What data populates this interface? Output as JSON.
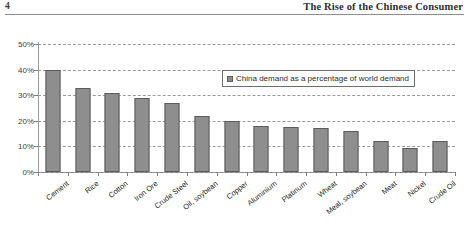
{
  "page": {
    "number": "4",
    "running_head": "The Rise of the Chinese Consumer"
  },
  "chart_data": {
    "type": "bar",
    "title": "",
    "xlabel": "",
    "ylabel": "",
    "ylim": [
      0,
      50
    ],
    "yticks": [
      0,
      10,
      20,
      30,
      40,
      50
    ],
    "ytick_labels": [
      "0%",
      "10%",
      "20%",
      "30%",
      "40%",
      "50%"
    ],
    "grid": true,
    "legend_position": "inside-upper-right",
    "legend": [
      "China demand as a percentage of world demand"
    ],
    "categories": [
      "Cement",
      "Rice",
      "Cotton",
      "Iron Ore",
      "Crude Steel",
      "Oil, soybean",
      "Copper",
      "Aluminium",
      "Platinum",
      "Wheat",
      "Meal, soybean",
      "Meat",
      "Nickel",
      "Crude Oil"
    ],
    "series": [
      {
        "name": "China demand as a percentage of world demand",
        "values": [
          40,
          33,
          31,
          29,
          27,
          22,
          20,
          18,
          17.5,
          17,
          16,
          12,
          9.5,
          12
        ]
      }
    ],
    "colors": {
      "bar_fill": "#8e8e8e",
      "bar_border": "#5c5c5c",
      "gridline": "#9a9a9a",
      "axis": "#7d7d7d"
    }
  }
}
